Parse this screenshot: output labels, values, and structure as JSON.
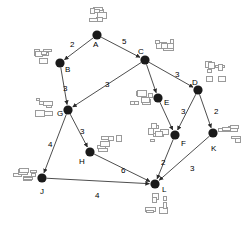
{
  "diagram": {
    "node_color": "#1a1a1a",
    "edge_color": "#3a3a3a",
    "mark_color": "#9a9a9a",
    "nodes": [
      {
        "id": "A",
        "label": "A",
        "x": 97,
        "y": 35,
        "lx": 93,
        "ly": 41
      },
      {
        "id": "B",
        "label": "B",
        "x": 60,
        "y": 63,
        "lx": 65,
        "ly": 66
      },
      {
        "id": "C",
        "label": "C",
        "x": 145,
        "y": 60,
        "lx": 138,
        "ly": 48
      },
      {
        "id": "D",
        "label": "D",
        "x": 198,
        "y": 90,
        "lx": 192,
        "ly": 79
      },
      {
        "id": "E",
        "label": "E",
        "x": 158,
        "y": 98,
        "lx": 164,
        "ly": 99
      },
      {
        "id": "F",
        "label": "F",
        "x": 175,
        "y": 135,
        "lx": 181,
        "ly": 140
      },
      {
        "id": "G",
        "label": "G",
        "x": 68,
        "y": 110,
        "lx": 57,
        "ly": 110
      },
      {
        "id": "H",
        "label": "H",
        "x": 90,
        "y": 152,
        "lx": 79,
        "ly": 158
      },
      {
        "id": "J",
        "label": "J",
        "x": 42,
        "y": 178,
        "lx": 40,
        "ly": 188
      },
      {
        "id": "K",
        "label": "K",
        "x": 213,
        "y": 133,
        "lx": 211,
        "ly": 145
      },
      {
        "id": "L",
        "label": "L",
        "x": 155,
        "y": 184,
        "lx": 162,
        "ly": 186
      }
    ],
    "edges": [
      {
        "from": "A",
        "to": "B",
        "weight": "2",
        "wx": 70,
        "wy": 41
      },
      {
        "from": "A",
        "to": "C",
        "weight": "5",
        "wx": 122,
        "wy": 38
      },
      {
        "from": "B",
        "to": "G",
        "weight": "3",
        "wx": 63,
        "wy": 85
      },
      {
        "from": "C",
        "to": "G",
        "weight": "3",
        "wx": 105,
        "wy": 81
      },
      {
        "from": "C",
        "to": "E",
        "weight": "",
        "wx": 0,
        "wy": 0
      },
      {
        "from": "C",
        "to": "D",
        "weight": "3",
        "wx": 175,
        "wy": 71
      },
      {
        "from": "D",
        "to": "F",
        "weight": "3",
        "wx": 181,
        "wy": 108
      },
      {
        "from": "D",
        "to": "K",
        "weight": "2",
        "wx": 214,
        "wy": 108
      },
      {
        "from": "E",
        "to": "F",
        "weight": "",
        "wx": 0,
        "wy": 0
      },
      {
        "from": "F",
        "to": "L",
        "weight": "2",
        "wx": 161,
        "wy": 159
      },
      {
        "from": "K",
        "to": "L",
        "weight": "3",
        "wx": 190,
        "wy": 165
      },
      {
        "from": "G",
        "to": "J",
        "weight": "4",
        "wx": 48,
        "wy": 141
      },
      {
        "from": "G",
        "to": "H",
        "weight": "3",
        "wx": 80,
        "wy": 128
      },
      {
        "from": "H",
        "to": "L",
        "weight": "6",
        "wx": 121,
        "wy": 167
      },
      {
        "from": "J",
        "to": "L",
        "weight": "4",
        "wx": 95,
        "wy": 192
      }
    ],
    "marks": [
      {
        "name": "mark-near-a",
        "x": 86,
        "y": 6,
        "w": 22,
        "h": 20
      },
      {
        "name": "mark-near-b",
        "x": 33,
        "y": 48,
        "w": 22,
        "h": 18
      },
      {
        "name": "mark-near-c",
        "x": 152,
        "y": 36,
        "w": 26,
        "h": 17
      },
      {
        "name": "mark-near-d",
        "x": 203,
        "y": 60,
        "w": 26,
        "h": 23
      },
      {
        "name": "mark-near-e",
        "x": 128,
        "y": 88,
        "w": 25,
        "h": 18
      },
      {
        "name": "mark-near-f",
        "x": 146,
        "y": 122,
        "w": 26,
        "h": 20
      },
      {
        "name": "mark-near-g",
        "x": 33,
        "y": 98,
        "w": 22,
        "h": 20
      },
      {
        "name": "mark-near-h",
        "x": 95,
        "y": 133,
        "w": 29,
        "h": 20
      },
      {
        "name": "mark-near-j",
        "x": 12,
        "y": 163,
        "w": 26,
        "h": 20
      },
      {
        "name": "mark-near-k",
        "x": 218,
        "y": 124,
        "w": 26,
        "h": 21
      },
      {
        "name": "mark-near-l",
        "x": 142,
        "y": 192,
        "w": 27,
        "h": 22
      }
    ]
  }
}
